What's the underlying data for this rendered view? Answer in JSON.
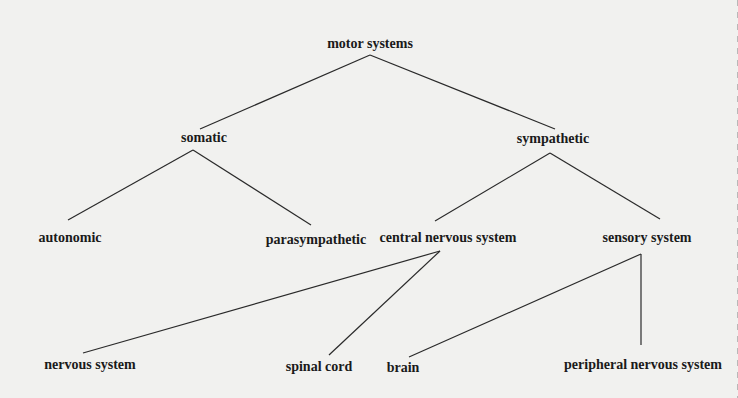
{
  "diagram": {
    "type": "tree",
    "nodes": [
      {
        "id": "motor-systems",
        "label": "motor systems",
        "x": 370,
        "y": 36
      },
      {
        "id": "somatic",
        "label": "somatic",
        "x": 204,
        "y": 130
      },
      {
        "id": "sympathetic",
        "label": "sympathetic",
        "x": 553,
        "y": 131
      },
      {
        "id": "autonomic",
        "label": "autonomic",
        "x": 70,
        "y": 230
      },
      {
        "id": "parasympathetic",
        "label": "parasympathetic",
        "x": 316,
        "y": 232
      },
      {
        "id": "central-nervous-system",
        "label": "central nervous system",
        "x": 448,
        "y": 230
      },
      {
        "id": "sensory-system",
        "label": "sensory system",
        "x": 647,
        "y": 230
      },
      {
        "id": "nervous-system",
        "label": "nervous system",
        "x": 90,
        "y": 357
      },
      {
        "id": "spinal-cord",
        "label": "spinal cord",
        "x": 319,
        "y": 359
      },
      {
        "id": "brain",
        "label": "brain",
        "x": 403,
        "y": 360
      },
      {
        "id": "peripheral-nervous-system",
        "label": "peripheral nervous system",
        "x": 643,
        "y": 357
      }
    ],
    "edges": [
      {
        "from": "motor-systems",
        "to": "somatic",
        "x1": 370,
        "y1": 55,
        "x2": 200,
        "y2": 129
      },
      {
        "from": "motor-systems",
        "to": "sympathetic",
        "x1": 370,
        "y1": 55,
        "x2": 555,
        "y2": 129
      },
      {
        "from": "somatic",
        "to": "autonomic",
        "x1": 193,
        "y1": 150,
        "x2": 68,
        "y2": 220
      },
      {
        "from": "somatic",
        "to": "parasympathetic",
        "x1": 193,
        "y1": 150,
        "x2": 311,
        "y2": 225
      },
      {
        "from": "sympathetic",
        "to": "central-nervous-system",
        "x1": 550,
        "y1": 153,
        "x2": 435,
        "y2": 221
      },
      {
        "from": "sympathetic",
        "to": "sensory-system",
        "x1": 550,
        "y1": 153,
        "x2": 660,
        "y2": 219
      },
      {
        "from": "central-nervous-system",
        "to": "nervous-system",
        "x1": 440,
        "y1": 251,
        "x2": 83,
        "y2": 353
      },
      {
        "from": "central-nervous-system",
        "to": "spinal-cord",
        "x1": 440,
        "y1": 251,
        "x2": 329,
        "y2": 355
      },
      {
        "from": "sensory-system",
        "to": "brain",
        "x1": 641,
        "y1": 254,
        "x2": 409,
        "y2": 357
      },
      {
        "from": "sensory-system",
        "to": "peripheral-nervous-system",
        "x1": 641,
        "y1": 254,
        "x2": 641,
        "y2": 345
      }
    ]
  }
}
